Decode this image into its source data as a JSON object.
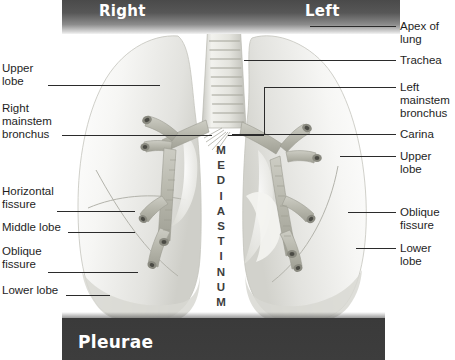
{
  "figure": {
    "title_top_left": "Right",
    "title_top_right": "Left",
    "title_bottom": "Pleurae",
    "mediastinum_label": "MEDIASTINUM",
    "colors": {
      "band_dark": "#4a4a4a",
      "footer_dark": "#3a3a3a",
      "band_text": "#ffffff",
      "annotation_text": "#1e1e1e",
      "leader_line": "#2b2b2b",
      "lung_fill": "#f2f2f0",
      "lung_shadow": "#cfcfcf",
      "bronchus_fill": "#b7b7ad",
      "trachea_fill": "#e3e3df"
    }
  },
  "labels_left": [
    {
      "id": "upper-lobe",
      "text": "Upper\nlobe"
    },
    {
      "id": "right-mainstem-bronchus",
      "text": "Right\nmainstem\nbronchus"
    },
    {
      "id": "horizontal-fissure",
      "text": "Horizontal\nfissure"
    },
    {
      "id": "middle-lobe",
      "text": "Middle lobe"
    },
    {
      "id": "oblique-fissure",
      "text": "Oblique\nfissure"
    },
    {
      "id": "lower-lobe",
      "text": "Lower lobe"
    }
  ],
  "labels_right": [
    {
      "id": "apex-of-lung",
      "text": "Apex of\nlung"
    },
    {
      "id": "trachea",
      "text": "Trachea"
    },
    {
      "id": "left-mainstem-bronchus",
      "text": "Left\nmainstem\nbronchus"
    },
    {
      "id": "carina",
      "text": "Carina"
    },
    {
      "id": "upper-lobe-left",
      "text": "Upper\nlobe"
    },
    {
      "id": "oblique-fissure-left",
      "text": "Oblique\nfissure"
    },
    {
      "id": "lower-lobe-left",
      "text": "Lower\nlobe"
    }
  ]
}
